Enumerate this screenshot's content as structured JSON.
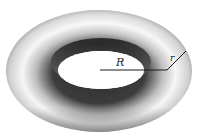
{
  "diagram": {
    "labels": {
      "major_radius": "R",
      "minor_radius": "r"
    },
    "colors": {
      "surface_light": "#f4f4f4",
      "surface_dark": "#3a3a3a",
      "line": "#1a1a1a",
      "background": "#ffffff"
    }
  }
}
